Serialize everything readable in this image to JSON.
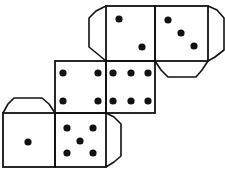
{
  "title": "Dice net",
  "colors": {
    "line": "#111111",
    "pip": "#111111",
    "background": "#ffffff"
  },
  "faces": [
    {
      "name": "face-two",
      "value": 2,
      "x": 106,
      "y": 6,
      "w": 49,
      "h": 55,
      "pips": [
        [
          119,
          19
        ],
        [
          142,
          47
        ]
      ]
    },
    {
      "name": "face-three",
      "value": 3,
      "x": 155,
      "y": 6,
      "w": 53,
      "h": 55,
      "pips": [
        [
          168,
          20
        ],
        [
          181,
          33
        ],
        [
          194,
          46
        ]
      ]
    },
    {
      "name": "face-four",
      "value": 4,
      "x": 55,
      "y": 61,
      "w": 51,
      "h": 52,
      "pips": [
        [
          63,
          73
        ],
        [
          98,
          73
        ],
        [
          63,
          101
        ],
        [
          98,
          101
        ]
      ]
    },
    {
      "name": "face-six",
      "value": 6,
      "x": 106,
      "y": 61,
      "w": 49,
      "h": 52,
      "pips": [
        [
          113,
          73
        ],
        [
          131,
          73
        ],
        [
          148,
          73
        ],
        [
          113,
          101
        ],
        [
          131,
          101
        ],
        [
          148,
          101
        ]
      ]
    },
    {
      "name": "face-one",
      "value": 1,
      "x": 3,
      "y": 113,
      "w": 52,
      "h": 54,
      "pips": [
        [
          28,
          142
        ]
      ]
    },
    {
      "name": "face-five",
      "value": 5,
      "x": 55,
      "y": 113,
      "w": 51,
      "h": 54,
      "pips": [
        [
          67,
          128
        ],
        [
          93,
          128
        ],
        [
          80,
          141
        ],
        [
          67,
          153
        ],
        [
          93,
          153
        ]
      ]
    }
  ],
  "tabs": [
    {
      "name": "tab-left-of-two",
      "points": "106,6 96,11 89,18 89,47 100,56 106,61"
    },
    {
      "name": "tab-right-of-three",
      "points": "208,6 217,10 224,18 224,50 215,57 208,61"
    },
    {
      "name": "tab-below-three",
      "points": "155,61 161,70 168,77 196,77 202,70 208,61"
    },
    {
      "name": "tab-above-one",
      "points": "3,113 8,104 14,98 42,98 49,104 55,113"
    },
    {
      "name": "tab-right-of-five",
      "points": "106,113 114,117 121,124 121,156 114,162 106,167"
    }
  ],
  "pip_radius": 3.6
}
